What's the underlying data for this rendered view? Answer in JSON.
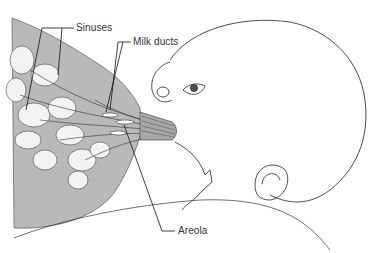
{
  "diagram": {
    "type": "anatomical-illustration",
    "labels": [
      {
        "id": "sinuses",
        "text": "Sinuses"
      },
      {
        "id": "milk_ducts",
        "text": "Milk ducts"
      },
      {
        "id": "areola",
        "text": "Areola"
      }
    ],
    "colors": {
      "breast_tissue": "#b8b8b8",
      "lobules": "#f2f2f2",
      "lines": "#222222",
      "background": "#ffffff"
    }
  }
}
